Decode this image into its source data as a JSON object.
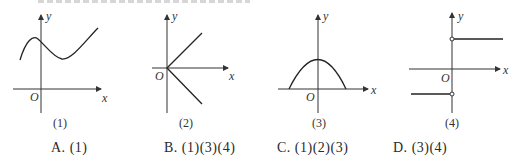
{
  "figure": {
    "graphs": [
      {
        "id": 1,
        "caption": "(1)",
        "y_label": "y",
        "x_label": "x",
        "origin_label": "O",
        "description": "smooth cubic-like curve: rises to a local max left of y-axis, dips to local min right of y-axis, then rises"
      },
      {
        "id": 2,
        "caption": "(2)",
        "y_label": "y",
        "x_label": "x",
        "origin_label": "O",
        "description": "two rays from origin into quadrant I and quadrant IV"
      },
      {
        "id": 3,
        "caption": "(3)",
        "y_label": "y",
        "x_label": "x",
        "origin_label": "O",
        "description": "downward-opening parabola with vertex on positive y-axis, meeting x-axis at two points"
      },
      {
        "id": 4,
        "caption": "(4)",
        "y_label": "y",
        "x_label": "x",
        "origin_label": "O",
        "description": "step function: horizontal ray y>0 for x>0 and y<0 for x<0, open circles at both y-axis endpoints"
      }
    ]
  },
  "options": [
    {
      "letter": "A.",
      "text": "(1)"
    },
    {
      "letter": "B.",
      "text": "(1)(3)(4)"
    },
    {
      "letter": "C.",
      "text": "(1)(2)(3)"
    },
    {
      "letter": "D.",
      "text": "(3)(4)"
    }
  ]
}
